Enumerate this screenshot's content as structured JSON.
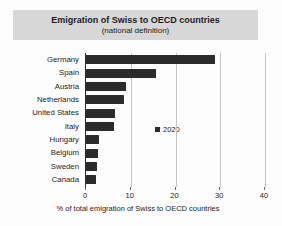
{
  "chart": {
    "title": "Emigration of Swiss to OECD countries",
    "subtitle": "(national definition)",
    "legend_label": "2020",
    "xlabel": "% of total emigration of Swiss to OECD countries"
  },
  "chart_data": {
    "type": "bar",
    "orientation": "horizontal",
    "title": "Emigration of Swiss to OECD countries",
    "subtitle": "(national definition)",
    "categories": [
      "Germany",
      "Spain",
      "Austria",
      "Netherlands",
      "United States",
      "Italy",
      "Hungary",
      "Belgium",
      "Sweden",
      "Canada"
    ],
    "series": [
      {
        "name": "2020",
        "values": [
          28.8,
          15.6,
          8.9,
          8.5,
          6.5,
          6.2,
          2.9,
          2.7,
          2.5,
          2.3
        ]
      }
    ],
    "xlabel": "% of total emigration of Swiss to OECD countries",
    "xlim": [
      0,
      40
    ],
    "xticks": [
      0,
      10,
      20,
      30,
      40
    ],
    "grid": true,
    "legend_position": "inside-center",
    "colors": {
      "bar": "#2b2b2b",
      "title_band_bg": "#d7d7d7",
      "gridline": "#c3c3c3",
      "axis_line": "#2a2a2a",
      "text": "#1c1c1c",
      "background": "#fdfdfd"
    }
  }
}
